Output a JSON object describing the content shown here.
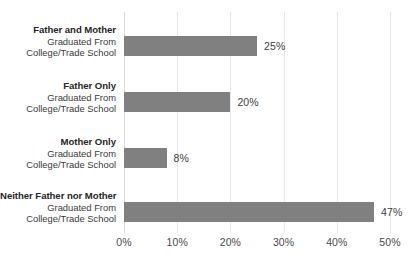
{
  "chart_data": {
    "type": "bar",
    "orientation": "horizontal",
    "title": "",
    "subtitle": "",
    "xlabel": "",
    "ylabel": "",
    "xlim": [
      0,
      50
    ],
    "grid": true,
    "legend": "none",
    "tick_labels": [
      "0%",
      "10%",
      "20%",
      "30%",
      "40%",
      "50%"
    ],
    "tick_values": [
      0,
      10,
      20,
      30,
      40,
      50
    ],
    "categories": [
      "Father and Mother Graduated From College/Trade School",
      "Father Only Graduated From College/Trade School",
      "Mother Only Graduated From College/Trade School",
      "Neither Father nor Mother Graduated From College/Trade School"
    ],
    "values": [
      25,
      20,
      8,
      47
    ],
    "value_labels": [
      "25%",
      "20%",
      "8%",
      "47%"
    ],
    "bar_color": "#808080",
    "gridline_color": "#e8e8e8",
    "text_color": "#262626"
  },
  "rows": [
    {
      "title": "Father and Mother",
      "line2": "Graduated From",
      "line3": "College/Trade School",
      "value": 25,
      "value_label": "25%"
    },
    {
      "title": "Father Only",
      "line2": "Graduated From",
      "line3": "College/Trade School",
      "value": 20,
      "value_label": "20%"
    },
    {
      "title": "Mother Only",
      "line2": "Graduated From",
      "line3": "College/Trade School",
      "value": 8,
      "value_label": "8%"
    },
    {
      "title": "Neither Father nor Mother",
      "line2": "Graduated From",
      "line3": "College/Trade School",
      "value": 47,
      "value_label": "47%"
    }
  ],
  "axis": {
    "ticks": [
      {
        "label": "0%",
        "value": 0
      },
      {
        "label": "10%",
        "value": 10
      },
      {
        "label": "20%",
        "value": 20
      },
      {
        "label": "30%",
        "value": 30
      },
      {
        "label": "40%",
        "value": 40
      },
      {
        "label": "50%",
        "value": 50
      }
    ]
  }
}
